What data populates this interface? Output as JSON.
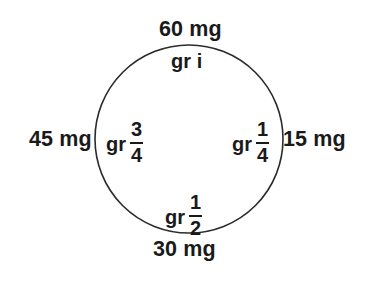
{
  "figure": {
    "type": "conversion-clock-diagram",
    "background_color": "#ffffff",
    "stroke_color": "#2b2b2b",
    "text_color": "#1a1a1a"
  },
  "circle": {
    "center_x": 189,
    "center_y": 139,
    "radius": 94,
    "stroke_width": 1.6
  },
  "labels": {
    "top_outer": "60 mg",
    "top_inner": "gr i",
    "left_outer": "45 mg",
    "right_outer": "15 mg",
    "bottom_outer": "30 mg"
  },
  "fractions": {
    "left_inner": {
      "prefix": "gr",
      "numerator": "3",
      "denominator": "4"
    },
    "right_inner": {
      "prefix": "gr",
      "numerator": "1",
      "denominator": "4"
    },
    "bottom_inner": {
      "prefix": "gr",
      "numerator": "1",
      "denominator": "2"
    }
  },
  "chart_data": {
    "type": "pie",
    "title": "",
    "subtitle": "",
    "xlabel": "",
    "ylabel": "",
    "grid": false,
    "legend_position": "none",
    "categories": [
      "gr i",
      "gr 1/4",
      "gr 1/2",
      "gr 3/4"
    ],
    "values": [
      60,
      15,
      30,
      45
    ],
    "units": "mg",
    "positions": [
      "top",
      "right",
      "bottom",
      "left"
    ],
    "angles_deg": [
      0,
      90,
      180,
      270
    ],
    "points": [
      {
        "position": "top",
        "angle_deg": 0,
        "grains_label": "gr i",
        "grains_value": 1,
        "mg_label": "60 mg",
        "mg_value": 60
      },
      {
        "position": "right",
        "angle_deg": 90,
        "grains_label": "gr 1/4",
        "grains_value": 0.25,
        "mg_label": "15 mg",
        "mg_value": 15
      },
      {
        "position": "bottom",
        "angle_deg": 180,
        "grains_label": "gr 1/2",
        "grains_value": 0.5,
        "mg_label": "30 mg",
        "mg_value": 30
      },
      {
        "position": "left",
        "angle_deg": 270,
        "grains_label": "gr 3/4",
        "grains_value": 0.75,
        "mg_label": "45 mg",
        "mg_value": 45
      }
    ]
  }
}
